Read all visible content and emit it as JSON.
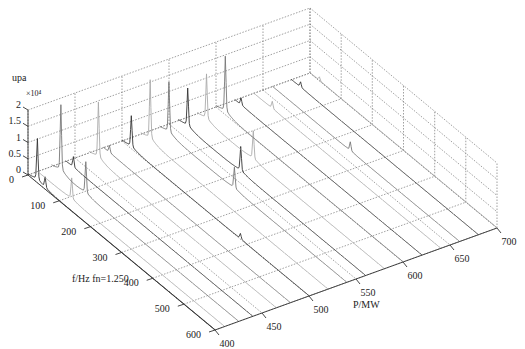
{
  "chart_data": {
    "type": "waterfall-3d",
    "title": "",
    "zlabel": "upa",
    "z_multiplier": "×10⁴",
    "xlabel": "f/Hz fn=1.250",
    "ylabel": "P/MW",
    "z_ticks": [
      "0",
      "0.5",
      "1",
      "1.5",
      "2"
    ],
    "z_range": [
      0,
      2
    ],
    "f_ticks": [
      "0",
      "100",
      "200",
      "300",
      "400",
      "500",
      "600"
    ],
    "f_range": [
      0,
      600
    ],
    "p_ticks": [
      "400",
      "450",
      "500",
      "550",
      "600",
      "650",
      "700"
    ],
    "p_range": [
      400,
      700
    ],
    "grid": true,
    "slices": [
      {
        "P": 400,
        "peaks": [
          {
            "f": 30,
            "z": 1.2
          },
          {
            "f": 55,
            "z": 0.3
          }
        ]
      },
      {
        "P": 410,
        "peaks": [
          {
            "f": 110,
            "z": 0.6
          }
        ]
      },
      {
        "P": 425,
        "peaks": [
          {
            "f": 30,
            "z": 1.9
          },
          {
            "f": 110,
            "z": 0.9
          }
        ]
      },
      {
        "P": 440,
        "peaks": [
          {
            "f": 25,
            "z": 0.3
          }
        ]
      },
      {
        "P": 465,
        "peaks": [
          {
            "f": 30,
            "z": 1.6
          }
        ]
      },
      {
        "P": 480,
        "peaks": [
          {
            "f": 20,
            "z": 0.2
          }
        ]
      },
      {
        "P": 500,
        "peaks": [
          {
            "f": 30,
            "z": 0.9
          },
          {
            "f": 380,
            "z": 0.15
          }
        ]
      },
      {
        "P": 520,
        "peaks": [
          {
            "f": 30,
            "z": 1.7
          }
        ]
      },
      {
        "P": 540,
        "peaks": [
          {
            "f": 30,
            "z": 1.45
          },
          {
            "f": 240,
            "z": 0.6
          }
        ]
      },
      {
        "P": 560,
        "peaks": [
          {
            "f": 30,
            "z": 1.1
          },
          {
            "f": 200,
            "z": 0.7
          }
        ]
      },
      {
        "P": 580,
        "peaks": [
          {
            "f": 30,
            "z": 1.3
          },
          {
            "f": 180,
            "z": 0.8
          }
        ]
      },
      {
        "P": 600,
        "peaks": [
          {
            "f": 30,
            "z": 1.6
          }
        ]
      },
      {
        "P": 620,
        "peaks": [
          {
            "f": 20,
            "z": 0.2
          }
        ]
      },
      {
        "P": 640,
        "peaks": [
          {
            "f": 60,
            "z": 0.2
          }
        ]
      },
      {
        "P": 660,
        "peaks": [
          {
            "f": 250,
            "z": 0.25
          }
        ]
      },
      {
        "P": 680,
        "peaks": [
          {
            "f": 30,
            "z": 0.15
          }
        ]
      },
      {
        "P": 700,
        "peaks": [
          {
            "f": 30,
            "z": 0.1
          }
        ]
      }
    ]
  }
}
